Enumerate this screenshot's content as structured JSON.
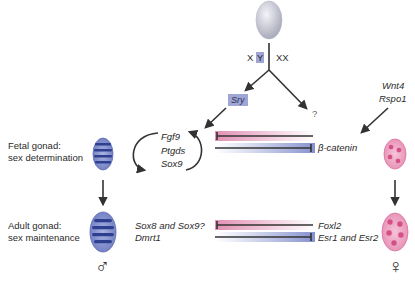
{
  "diagram": {
    "top": {
      "chromosome_labels": {
        "male_x": "X",
        "male_y": "Y",
        "female": "XX"
      },
      "male_gene": "Sry",
      "female_unknown": "?"
    },
    "rows": {
      "fetal": {
        "label_line1": "Fetal gonad:",
        "label_line2": "sex determination",
        "male_genes": [
          "Fgf9",
          "Ptgds",
          "Sox9"
        ],
        "female_factor": "β-catenin",
        "female_inducers": [
          "Wnt4",
          "Rspo1"
        ]
      },
      "adult": {
        "label_line1": "Adult gonad:",
        "label_line2": "sex maintenance",
        "male_genes": [
          "Sox8 and Sox9?",
          "Dmrt1"
        ],
        "female_genes": [
          "Foxl2",
          "Esr1 and Esr2"
        ]
      }
    },
    "symbols": {
      "male": "♂",
      "female": "♀"
    },
    "colors": {
      "testis": "#5a6bb5",
      "testis_dark": "#2e3f8f",
      "ovary": "#e58bb0",
      "ovary_dark": "#c94a7e",
      "egg": "#c9cbd6",
      "pink_bar": "#e79cbc",
      "blue_bar": "#8f9ad0",
      "arrow": "#333333"
    }
  }
}
